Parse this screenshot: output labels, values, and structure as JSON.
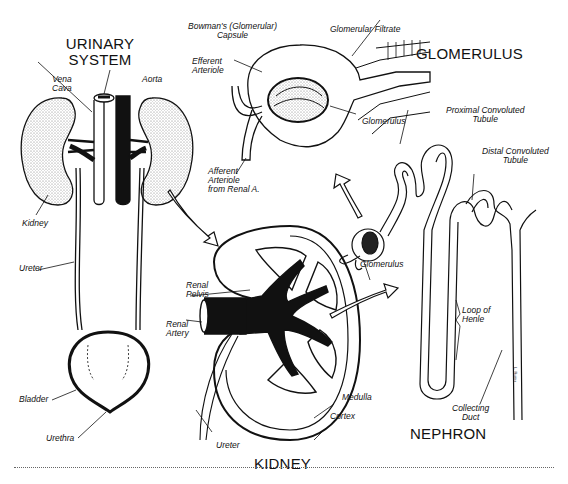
{
  "titles": {
    "urinary_system": "URINARY\nSYSTEM",
    "urinary_line1": "URINARY",
    "urinary_line2": "SYSTEM",
    "glomerulus": "GLOMERULUS",
    "kidney": "KIDNEY",
    "nephron": "NEPHRON"
  },
  "urinary_system_labels": {
    "vena_cava_1": "Vena",
    "vena_cava_2": "Cava",
    "aorta": "Aorta",
    "kidney": "Kidney",
    "ureter": "Ureter",
    "bladder": "Bladder",
    "urethra": "Urethra"
  },
  "glomerulus_labels": {
    "bowmans_1": "Bowman's (Glomerular)",
    "bowmans_2": "Capsule",
    "filtrate": "Glomerular Filtrate",
    "efferent_1": "Efferent",
    "efferent_2": "Arteriole",
    "glomerulus": "Glomerulus",
    "afferent_1": "Afferent",
    "afferent_2": "Arteriole",
    "afferent_3": "from Renal A."
  },
  "kidney_labels": {
    "pelvis_1": "Renal",
    "pelvis_2": "Pelvis",
    "artery_1": "Renal",
    "artery_2": "Artery",
    "medulla": "Medulla",
    "cortex": "Cortex",
    "ureter": "Ureter"
  },
  "nephron_labels": {
    "proximal_1": "Proximal Convoluted",
    "proximal_2": "Tubule",
    "distal_1": "Distal Convoluted",
    "distal_2": "Tubule",
    "glomerulus": "Glomerulus",
    "loop_1": "Loop of",
    "loop_2": "Henle",
    "collecting_1": "Collecting",
    "collecting_2": "Duct"
  },
  "signature": "L. Ruiter",
  "colors": {
    "ink": "#111111",
    "stipple": "#d9d9d9",
    "paper": "#ffffff"
  }
}
